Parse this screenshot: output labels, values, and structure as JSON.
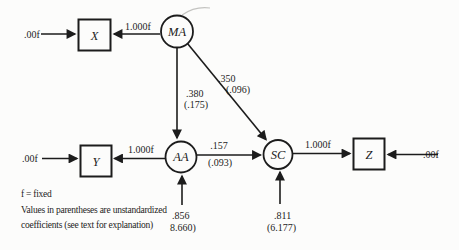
{
  "colors": {
    "ink": "#1c1c1c",
    "background": "#fcfcfb"
  },
  "diagram": {
    "nodes": {
      "X": "X",
      "Y": "Y",
      "Z": "Z",
      "MA": "MA",
      "AA": "AA",
      "SC": "SC"
    },
    "edges": {
      "x_residual": {
        "label": ".00f"
      },
      "y_residual": {
        "label": ".00f"
      },
      "z_residual": {
        "label": ".00f"
      },
      "ma_to_x": {
        "label": "1.000f"
      },
      "aa_to_y": {
        "label": "1.000f"
      },
      "sc_to_z": {
        "label": "1.000f"
      },
      "ma_to_aa": {
        "standardized": ".380",
        "unstandardized": "(.175)"
      },
      "ma_to_sc": {
        "standardized": ".350",
        "unstandardized": "(.096)"
      },
      "aa_to_sc": {
        "standardized": ".157",
        "unstandardized": "(.093)"
      },
      "aa_error": {
        "standardized": ".856",
        "unstandardized": "8.660)"
      },
      "sc_error": {
        "standardized": ".811",
        "unstandardized": "(6.177)"
      }
    },
    "footnote": {
      "line1": "f = fixed",
      "line2": "Values in parentheses are unstandardized",
      "line3": "coefficients (see text for explanation)"
    }
  }
}
